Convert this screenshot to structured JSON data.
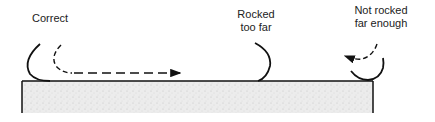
{
  "diagram": {
    "labels": {
      "correct": "Correct",
      "rocked_too_far_line1": "Rocked",
      "rocked_too_far_line2": "too far",
      "not_rocked_line1": "Not rocked",
      "not_rocked_line2": "far enough"
    },
    "colors": {
      "stroke": "#111111",
      "surface_fill": "#e8e8e8",
      "text": "#222222"
    }
  }
}
